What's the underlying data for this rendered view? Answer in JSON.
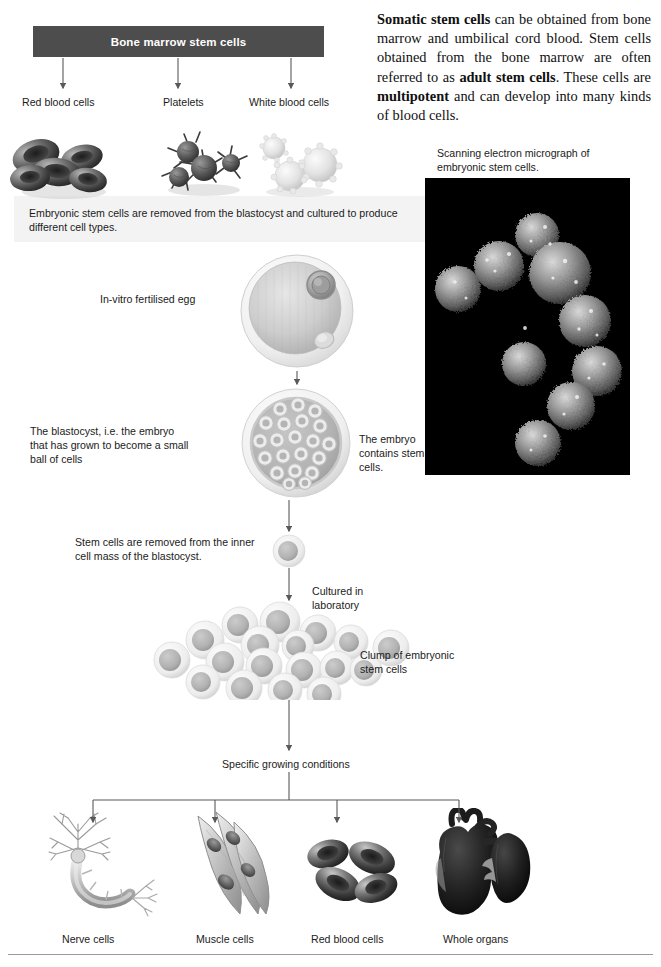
{
  "intro": {
    "segments": [
      {
        "text": "Somatic stem cells",
        "bold": true
      },
      {
        "text": " can be obtained from bone marrow and umbilical cord blood. Stem cells obtained from the bone marrow are often referred to as ",
        "bold": false
      },
      {
        "text": "adult stem cells",
        "bold": true
      },
      {
        "text": ". These cells are ",
        "bold": false
      },
      {
        "text": "multipotent",
        "bold": true
      },
      {
        "text": " and can develop into many kinds of blood cells.",
        "bold": false
      }
    ],
    "plain": "Somatic stem cells can be obtained from bone marrow and umbilical cord blood. Stem cells obtained from the bone marrow are often referred to as adult stem cells. These cells are multipotent and can develop into many kinds of blood cells."
  },
  "bone_marrow": {
    "banner": "Bone marrow stem cells",
    "banner_color": "#4d4d4d",
    "outputs": [
      {
        "label": "Red blood cells",
        "icon": "red-blood-cells-illustration"
      },
      {
        "label": "Platelets",
        "icon": "platelets-illustration"
      },
      {
        "label": "White blood cells",
        "icon": "white-blood-cells-illustration"
      }
    ]
  },
  "micrograph": {
    "caption": "Scanning electron micrograph of embryonic stem cells.",
    "background": "#000000"
  },
  "embryonic": {
    "intro": "Embryonic stem cells are removed from the blastocyst and cultured to produce different cell types.",
    "steps": [
      {
        "id": "egg",
        "label": "In-vitro fertilised egg",
        "icon": "fertilised-egg-illustration"
      },
      {
        "id": "blastocyst",
        "label": "The blastocyst, i.e. the embryo that has grown to become a small ball of cells",
        "side_label": "The embryo contains stem cells.",
        "icon": "blastocyst-illustration"
      },
      {
        "id": "stemcell",
        "label": "Stem cells are removed from the inner cell mass of the blastocyst.",
        "icon": "single-stem-cell-illustration"
      },
      {
        "id": "culture",
        "label": "Cultured in laboratory",
        "side_label": "Clump of embryonic stem cells",
        "icon": "stem-cell-clump-illustration"
      },
      {
        "id": "conditions",
        "label": "Specific growing conditions"
      }
    ]
  },
  "differentiation": {
    "outputs": [
      {
        "label": "Nerve cells",
        "icon": "neuron-illustration"
      },
      {
        "label": "Muscle cells",
        "icon": "muscle-cells-illustration"
      },
      {
        "label": "Red blood cells",
        "icon": "red-blood-cells-illustration"
      },
      {
        "label": "Whole organs",
        "icon": "heart-and-kidney-illustration"
      }
    ]
  }
}
